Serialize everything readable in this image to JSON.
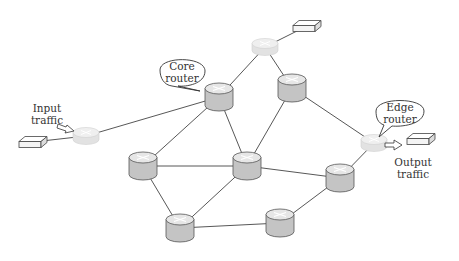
{
  "diagram": {
    "type": "network-topology",
    "labels": {
      "core_router": [
        "Core",
        "router"
      ],
      "edge_router": [
        "Edge",
        "router"
      ],
      "input_traffic": [
        "Input",
        "traffic"
      ],
      "output_traffic": [
        "Output",
        "traffic"
      ]
    },
    "colors": {
      "core_body": "#c4c4c4",
      "core_top": "#e6e6e6",
      "edge_body": "#e2e2e2",
      "edge_top": "#efefef",
      "line": "#444444",
      "host_face": "#f4f4f4"
    },
    "nodes": [
      {
        "id": "edge-top",
        "kind": "edge",
        "x": 265,
        "y": 47
      },
      {
        "id": "edge-left",
        "kind": "edge",
        "x": 86,
        "y": 136
      },
      {
        "id": "edge-right",
        "kind": "edge",
        "x": 374,
        "y": 143
      },
      {
        "id": "core-a",
        "kind": "core",
        "x": 219,
        "y": 97
      },
      {
        "id": "core-b",
        "kind": "core",
        "x": 292,
        "y": 88
      },
      {
        "id": "core-c",
        "kind": "core",
        "x": 143,
        "y": 166
      },
      {
        "id": "core-d",
        "kind": "core",
        "x": 247,
        "y": 166
      },
      {
        "id": "core-e",
        "kind": "core",
        "x": 340,
        "y": 178
      },
      {
        "id": "core-f",
        "kind": "core",
        "x": 180,
        "y": 228
      },
      {
        "id": "core-g",
        "kind": "core",
        "x": 280,
        "y": 223
      },
      {
        "id": "host-top",
        "kind": "host",
        "x": 307,
        "y": 26
      },
      {
        "id": "host-left",
        "kind": "host",
        "x": 33,
        "y": 142
      },
      {
        "id": "host-right",
        "kind": "host",
        "x": 421,
        "y": 139
      }
    ],
    "links": [
      [
        "edge-top",
        "host-top"
      ],
      [
        "edge-top",
        "core-a"
      ],
      [
        "edge-top",
        "core-b"
      ],
      [
        "edge-left",
        "host-left"
      ],
      [
        "edge-left",
        "core-a"
      ],
      [
        "edge-right",
        "core-b"
      ],
      [
        "edge-right",
        "core-e"
      ],
      [
        "core-a",
        "core-c"
      ],
      [
        "core-a",
        "core-d"
      ],
      [
        "core-b",
        "core-d"
      ],
      [
        "core-c",
        "core-d"
      ],
      [
        "core-c",
        "core-f"
      ],
      [
        "core-d",
        "core-e"
      ],
      [
        "core-d",
        "core-f"
      ],
      [
        "core-f",
        "core-g"
      ],
      [
        "core-g",
        "core-e"
      ]
    ]
  }
}
